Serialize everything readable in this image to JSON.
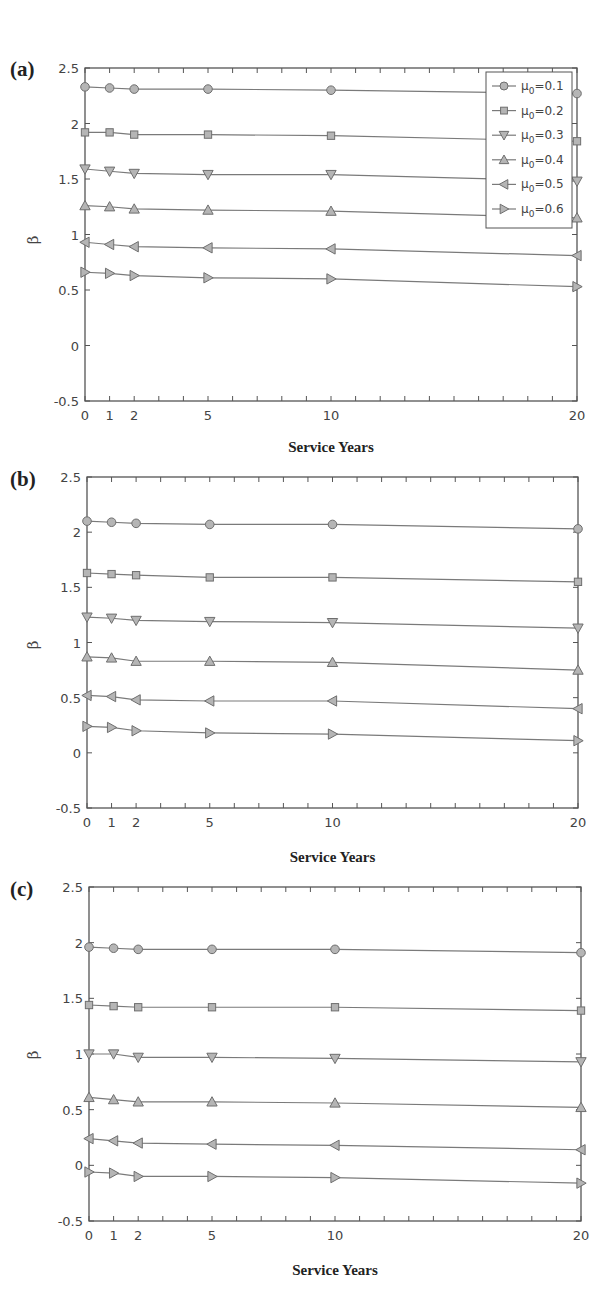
{
  "figure": {
    "panels": [
      {
        "label": "(a)",
        "xlabel": "Service Years",
        "ylabel": "β"
      },
      {
        "label": "(b)",
        "xlabel": "Service Years",
        "ylabel": "β"
      },
      {
        "label": "(c)",
        "xlabel": "Service Years",
        "ylabel": "β"
      }
    ],
    "colors": {
      "line": "#7a7a7a",
      "marker_fill": "#b5b5b5",
      "marker_stroke": "#6e6e6e",
      "axis": "#555555"
    }
  },
  "chart_data": [
    {
      "type": "line",
      "title": "(a)",
      "xlabel": "Service Years",
      "ylabel": "β",
      "x": [
        0,
        1,
        2,
        5,
        10,
        20
      ],
      "xticks": [
        0,
        1,
        2,
        5,
        10,
        20
      ],
      "yticks": [
        -0.5,
        0,
        0.5,
        1,
        1.5,
        2,
        2.5
      ],
      "xlim": [
        0,
        20
      ],
      "ylim": [
        -0.5,
        2.5
      ],
      "grid": false,
      "legend_position": "upper right",
      "series": [
        {
          "name": "μ0=0.1",
          "marker": "circle",
          "values": [
            2.33,
            2.32,
            2.31,
            2.31,
            2.3,
            2.27
          ]
        },
        {
          "name": "μ0=0.2",
          "marker": "square",
          "values": [
            1.92,
            1.92,
            1.9,
            1.9,
            1.89,
            1.84
          ]
        },
        {
          "name": "μ0=0.3",
          "marker": "triangle-down",
          "values": [
            1.59,
            1.57,
            1.55,
            1.54,
            1.54,
            1.48
          ]
        },
        {
          "name": "μ0=0.4",
          "marker": "triangle-up",
          "values": [
            1.26,
            1.25,
            1.23,
            1.22,
            1.21,
            1.15
          ]
        },
        {
          "name": "μ0=0.5",
          "marker": "triangle-left",
          "values": [
            0.93,
            0.91,
            0.89,
            0.88,
            0.87,
            0.81
          ]
        },
        {
          "name": "μ0=0.6",
          "marker": "triangle-right",
          "values": [
            0.66,
            0.65,
            0.63,
            0.61,
            0.6,
            0.53
          ]
        }
      ]
    },
    {
      "type": "line",
      "title": "(b)",
      "xlabel": "Service Years",
      "ylabel": "β",
      "x": [
        0,
        1,
        2,
        5,
        10,
        20
      ],
      "xticks": [
        0,
        1,
        2,
        5,
        10,
        20
      ],
      "yticks": [
        -0.5,
        0,
        0.5,
        1,
        1.5,
        2,
        2.5
      ],
      "xlim": [
        0,
        20
      ],
      "ylim": [
        -0.5,
        2.5
      ],
      "grid": false,
      "series": [
        {
          "name": "μ0=0.1",
          "marker": "circle",
          "values": [
            2.1,
            2.09,
            2.08,
            2.07,
            2.07,
            2.03
          ]
        },
        {
          "name": "μ0=0.2",
          "marker": "square",
          "values": [
            1.63,
            1.62,
            1.61,
            1.59,
            1.59,
            1.55
          ]
        },
        {
          "name": "μ0=0.3",
          "marker": "triangle-down",
          "values": [
            1.23,
            1.22,
            1.2,
            1.19,
            1.18,
            1.13
          ]
        },
        {
          "name": "μ0=0.4",
          "marker": "triangle-up",
          "values": [
            0.87,
            0.86,
            0.83,
            0.83,
            0.82,
            0.75
          ]
        },
        {
          "name": "μ0=0.5",
          "marker": "triangle-left",
          "values": [
            0.52,
            0.51,
            0.48,
            0.47,
            0.47,
            0.4
          ]
        },
        {
          "name": "μ0=0.6",
          "marker": "triangle-right",
          "values": [
            0.24,
            0.23,
            0.2,
            0.18,
            0.17,
            0.11
          ]
        }
      ]
    },
    {
      "type": "line",
      "title": "(c)",
      "xlabel": "Service Years",
      "ylabel": "β",
      "x": [
        0,
        1,
        2,
        5,
        10,
        20
      ],
      "xticks": [
        0,
        1,
        2,
        5,
        10,
        20
      ],
      "yticks": [
        -0.5,
        0,
        0.5,
        1,
        1.5,
        2,
        2.5
      ],
      "xlim": [
        0,
        20
      ],
      "ylim": [
        -0.5,
        2.5
      ],
      "grid": false,
      "series": [
        {
          "name": "μ0=0.1",
          "marker": "circle",
          "values": [
            1.96,
            1.95,
            1.94,
            1.94,
            1.94,
            1.91
          ]
        },
        {
          "name": "μ0=0.2",
          "marker": "square",
          "values": [
            1.44,
            1.43,
            1.42,
            1.42,
            1.42,
            1.39
          ]
        },
        {
          "name": "μ0=0.3",
          "marker": "triangle-down",
          "values": [
            1.0,
            1.0,
            0.97,
            0.97,
            0.96,
            0.93
          ]
        },
        {
          "name": "μ0=0.4",
          "marker": "triangle-up",
          "values": [
            0.61,
            0.59,
            0.57,
            0.57,
            0.56,
            0.52
          ]
        },
        {
          "name": "μ0=0.5",
          "marker": "triangle-left",
          "values": [
            0.24,
            0.22,
            0.2,
            0.19,
            0.18,
            0.14
          ]
        },
        {
          "name": "μ0=0.6",
          "marker": "triangle-right",
          "values": [
            -0.06,
            -0.07,
            -0.1,
            -0.1,
            -0.11,
            -0.16
          ]
        }
      ]
    }
  ],
  "legend": {
    "entries": [
      {
        "mu": "μ",
        "sub": "0",
        "value": "=0.1",
        "marker": "circle"
      },
      {
        "mu": "μ",
        "sub": "0",
        "value": "=0.2",
        "marker": "square"
      },
      {
        "mu": "μ",
        "sub": "0",
        "value": "=0.3",
        "marker": "triangle-down"
      },
      {
        "mu": "μ",
        "sub": "0",
        "value": "=0.4",
        "marker": "triangle-up"
      },
      {
        "mu": "μ",
        "sub": "0",
        "value": "=0.5",
        "marker": "triangle-left"
      },
      {
        "mu": "μ",
        "sub": "0",
        "value": "=0.6",
        "marker": "triangle-right"
      }
    ]
  }
}
